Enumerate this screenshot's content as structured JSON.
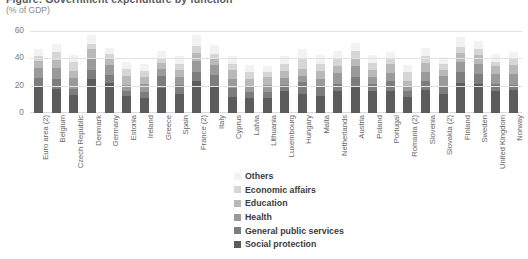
{
  "title": "Figure: Government expenditure by function",
  "subtitle": "(% of GDP)",
  "yaxis": {
    "ticks": [
      "0",
      "20",
      "40",
      "60"
    ]
  },
  "legend": {
    "items": [
      {
        "label": "Others",
        "color": "#f2f2f2"
      },
      {
        "label": "Economic affairs",
        "color": "#d6d6d6"
      },
      {
        "label": "Education",
        "color": "#b9b9b9"
      },
      {
        "label": "Health",
        "color": "#9a9a9a"
      },
      {
        "label": "General public services",
        "color": "#7d7d7d"
      },
      {
        "label": "Social protection",
        "color": "#5c5c5c"
      }
    ]
  },
  "chart_data": {
    "type": "bar",
    "subtype": "stacked-column",
    "title": "Figure: Government expenditure by function",
    "subtitle": "(% of GDP)",
    "xlabel": "",
    "ylabel": "(% of GDP)",
    "ylim": [
      0,
      60
    ],
    "yticks": [
      0,
      20,
      40,
      60
    ],
    "grid": true,
    "legend_position": "bottom-center",
    "series_order_bottom_to_top": [
      "Social protection",
      "General public services",
      "Health",
      "Education",
      "Economic affairs",
      "Others"
    ],
    "colors": {
      "Social protection": "#5c5c5c",
      "General public services": "#7d7d7d",
      "Health": "#9a9a9a",
      "Education": "#b9b9b9",
      "Economic affairs": "#d6d6d6",
      "Others": "#f2f2f2"
    },
    "categories": [
      "Euro area (2)",
      "Belgium",
      "Czech Republic",
      "Denmark",
      "Germany",
      "Estonia",
      "Ireland",
      "Greece",
      "Spain",
      "France (2)",
      "Italy",
      "Cyprus",
      "Latvia",
      "Lithuania",
      "Luxembourg",
      "Hungary",
      "Malta",
      "Netherlands",
      "Austria",
      "Poland",
      "Portugal",
      "Romania (2)",
      "Slovenia",
      "Slovakia (2)",
      "Finland",
      "Sweden",
      "United Kingdom",
      "Norway"
    ],
    "series": [
      {
        "name": "Social protection",
        "values": [
          19.0,
          17.4,
          13.0,
          24.6,
          22.0,
          12.2,
          11.0,
          18.6,
          13.6,
          23.6,
          19.4,
          12.0,
          11.0,
          11.0,
          15.8,
          13.8,
          12.6,
          16.0,
          20.0,
          16.0,
          16.0,
          11.6,
          17.0,
          13.6,
          21.8,
          21.4,
          15.8,
          16.6
        ]
      },
      {
        "name": "General public services",
        "values": [
          6.6,
          7.4,
          4.6,
          7.0,
          6.0,
          3.6,
          4.4,
          8.6,
          6.6,
          6.4,
          8.4,
          6.4,
          4.6,
          4.4,
          5.0,
          8.6,
          6.6,
          5.0,
          6.4,
          5.4,
          7.2,
          4.6,
          6.4,
          6.0,
          8.0,
          7.2,
          5.2,
          4.2
        ]
      },
      {
        "name": "Health",
        "values": [
          7.2,
          8.0,
          8.0,
          8.4,
          7.0,
          5.0,
          6.0,
          5.0,
          6.4,
          8.2,
          7.2,
          6.4,
          4.0,
          5.4,
          4.6,
          4.8,
          5.6,
          8.0,
          8.0,
          4.8,
          6.2,
          3.8,
          6.6,
          7.6,
          7.4,
          7.0,
          7.6,
          8.0
        ]
      },
      {
        "name": "Education",
        "values": [
          5.0,
          6.2,
          5.2,
          7.2,
          4.4,
          6.6,
          5.0,
          4.4,
          4.6,
          5.6,
          4.4,
          6.4,
          5.6,
          5.4,
          5.2,
          5.0,
          5.6,
          5.4,
          5.2,
          5.4,
          6.4,
          3.6,
          6.4,
          4.2,
          6.6,
          6.8,
          5.8,
          6.0
        ]
      },
      {
        "name": "Economic affairs",
        "values": [
          4.2,
          6.0,
          6.8,
          3.6,
          3.6,
          4.8,
          4.4,
          3.6,
          5.0,
          5.0,
          4.0,
          4.8,
          4.8,
          3.6,
          5.2,
          7.2,
          5.4,
          4.8,
          5.6,
          5.2,
          4.0,
          6.4,
          5.0,
          4.4,
          4.8,
          4.6,
          3.2,
          4.4
        ]
      },
      {
        "name": "Others",
        "values": [
          5.0,
          5.2,
          5.0,
          6.6,
          4.6,
          5.2,
          5.0,
          5.0,
          5.4,
          8.0,
          6.2,
          5.6,
          5.2,
          4.6,
          5.6,
          7.2,
          6.4,
          6.2,
          6.0,
          5.4,
          5.2,
          5.4,
          6.0,
          5.2,
          7.2,
          5.4,
          5.6,
          5.8
        ]
      }
    ]
  }
}
